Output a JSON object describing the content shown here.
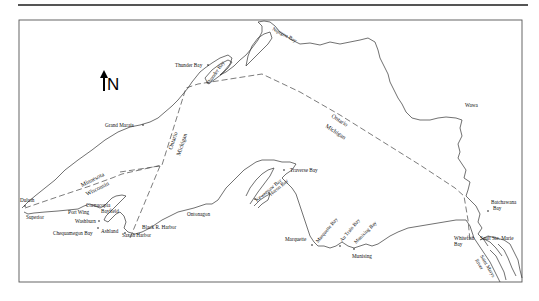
{
  "map": {
    "north_label": "N",
    "border_labels": {
      "ontario_west": "Ontario",
      "michigan_west": "Michigan",
      "ontario_east": "Ontario",
      "michigan_east": "Michigan",
      "minnesota": "Minnesota",
      "wisconsin": "Wisconsin"
    },
    "places": {
      "thunder_bay_city": "Thunder Bay",
      "thunder_bay_water": "Thunder Bay",
      "nipigon_bay": "Nipigon Bay",
      "grand_marais": "Grand Marais",
      "wawa": "Wawa",
      "duluth": "Duluth",
      "superior": "Superior",
      "port_wing": "Port Wing",
      "cornucopia": "Cornucopia",
      "bayfield": "Bayfield",
      "washburn": "Washburn",
      "chequamegon_bay": "Chequamegon Bay",
      "ashland": "Ashland",
      "saxon_harbor": "Saxon Harbor",
      "black_r_harbor": "Black R. Harbor",
      "ontonagon": "Ontonagon",
      "traverse_bay": "Traverse Bay",
      "keweenaw_bay": "Keweenaw Bay",
      "huron_bay": "Huron Bay",
      "marquette": "Marquette",
      "marquette_bay": "Marquette Bay",
      "au_train_bay": "Au Train Bay",
      "munising_bay": "Munising Bay",
      "munising": "Munising",
      "batchawana_bay_1": "Batchawana",
      "batchawana_bay_2": "Bay",
      "whitefish_bay_1": "Whitefish",
      "whitefish_bay_2": "Bay",
      "sault_ste_marie": "Sault Ste. Marie",
      "st_marys_river_1": "Saint Marys",
      "st_marys_river_2": "River"
    }
  }
}
